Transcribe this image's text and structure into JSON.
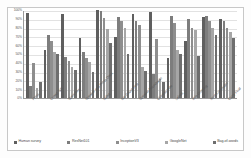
{
  "chart_data": {
    "type": "bar",
    "title": "",
    "xlabel": "",
    "ylabel": "",
    "ylim": [
      0,
      100
    ],
    "grid": true,
    "legend_position": "bottom",
    "ytick_labels": [
      "100%",
      "90%",
      "80%",
      "70%",
      "60%",
      "50%",
      "40%",
      "30%",
      "20%",
      "10%",
      "0%"
    ],
    "ytick_values": [
      100,
      90,
      80,
      70,
      60,
      50,
      40,
      30,
      20,
      10,
      0
    ],
    "categories": [
      "Press",
      "Crowd Talk",
      "Speeches",
      "Speaker and Press Deck",
      "Ballot",
      "Bar Count Fest",
      "Speaker Roundtable",
      "Chinese Vote",
      "Labels",
      "Mile Greeting",
      "Next Contender",
      "Carry Final"
    ],
    "series": [
      {
        "name": "Human survey",
        "color": "#5f5f5f",
        "values": [
          97,
          54,
          95,
          68,
          100,
          69,
          95,
          98,
          46,
          65,
          92,
          90
        ]
      },
      {
        "name": "ResNet101",
        "color": "#7d7d7d",
        "values": [
          14,
          72,
          47,
          52,
          99,
          92,
          88,
          27,
          93,
          90,
          93,
          88
        ]
      },
      {
        "name": "InceptionV3",
        "color": "#8e8e8e",
        "values": [
          40,
          65,
          42,
          46,
          91,
          87,
          83,
          67,
          85,
          80,
          88,
          80
        ]
      },
      {
        "name": "GoogleNet",
        "color": "#a6a6a6",
        "values": [
          11,
          52,
          35,
          41,
          78,
          79,
          35,
          22,
          55,
          77,
          80,
          75
        ]
      },
      {
        "name": "Bag-of-words",
        "color": "#6e6e6e",
        "values": [
          18,
          50,
          32,
          29,
          62,
          50,
          31,
          18,
          50,
          48,
          72,
          68
        ]
      }
    ]
  },
  "legend": {
    "items": [
      {
        "label": "Human survey",
        "color": "#5f5f5f"
      },
      {
        "label": "ResNet101",
        "color": "#7d7d7d"
      },
      {
        "label": "InceptionV3",
        "color": "#8e8e8e"
      },
      {
        "label": "GoogleNet",
        "color": "#a6a6a6"
      },
      {
        "label": "Bag-of-words",
        "color": "#6e6e6e"
      }
    ]
  }
}
